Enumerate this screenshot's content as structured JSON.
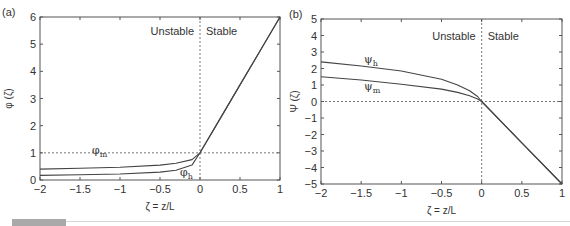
{
  "figure": {
    "footer": {
      "bar_color": "#a9a9a9",
      "line_color": "#d8d8d8"
    }
  },
  "chart_data": [
    {
      "type": "line",
      "panel": "(a)",
      "title": "",
      "xlabel": "ζ = z/L",
      "ylabel": "φ (ζ)",
      "xlim": [
        -2,
        1
      ],
      "ylim": [
        0,
        6
      ],
      "xticks": [
        -2,
        -1.5,
        -1,
        -0.5,
        0,
        0.5,
        1
      ],
      "xtick_labels": [
        "−2",
        "−1.5",
        "−1",
        "−0.5",
        "0",
        "0.5",
        "1"
      ],
      "yticks": [
        0,
        1,
        2,
        3,
        4,
        5,
        6
      ],
      "ytick_labels": [
        "0",
        "1",
        "2",
        "3",
        "4",
        "5",
        "6"
      ],
      "grid": false,
      "reference_lines": {
        "vertical_x": 0,
        "horizontal_y": 1,
        "style": "dashed"
      },
      "region_labels": [
        "Unstable",
        "Stable"
      ],
      "series": [
        {
          "name": "φm",
          "label_main": "φ",
          "label_sub": "m",
          "x": [
            -2,
            -1.5,
            -1,
            -0.5,
            -0.3,
            -0.1,
            0,
            0.25,
            0.5,
            0.75,
            1
          ],
          "y": [
            0.4,
            0.43,
            0.47,
            0.55,
            0.62,
            0.75,
            1.0,
            2.25,
            3.5,
            4.75,
            6.0
          ]
        },
        {
          "name": "φh",
          "label_main": "φ",
          "label_sub": "h",
          "x": [
            -2,
            -1.5,
            -1,
            -0.5,
            -0.3,
            -0.1,
            0,
            0.25,
            0.5,
            0.75,
            1
          ],
          "y": [
            0.17,
            0.19,
            0.22,
            0.29,
            0.36,
            0.55,
            1.0,
            2.25,
            3.5,
            4.75,
            6.0
          ]
        }
      ],
      "panel_label": "(a)"
    },
    {
      "type": "line",
      "panel": "(b)",
      "title": "",
      "xlabel": "ζ = z/L",
      "ylabel": "Ψ (ζ)",
      "xlim": [
        -2,
        1
      ],
      "ylim": [
        -5,
        5
      ],
      "xticks": [
        -2,
        -1.5,
        -1,
        -0.5,
        0,
        0.5,
        1
      ],
      "xtick_labels": [
        "−2",
        "−1.5",
        "−1",
        "−0.5",
        "0",
        "0.5",
        "1"
      ],
      "yticks": [
        -5,
        -4,
        -3,
        -2,
        -1,
        0,
        1,
        2,
        3,
        4,
        5
      ],
      "ytick_labels": [
        "−5",
        "−4",
        "−3",
        "−2",
        "−1",
        "0",
        "1",
        "2",
        "3",
        "4",
        "5"
      ],
      "grid": false,
      "reference_lines": {
        "vertical_x": 0,
        "horizontal_y": 0,
        "style": "dashed"
      },
      "region_labels": [
        "Unstable",
        "Stable"
      ],
      "series": [
        {
          "name": "ψh",
          "label_main": "ψ",
          "label_sub": "h",
          "x": [
            -2,
            -1.5,
            -1,
            -0.5,
            -0.3,
            -0.15,
            -0.05,
            0,
            0.5,
            1
          ],
          "y": [
            2.4,
            2.15,
            1.85,
            1.35,
            1.0,
            0.65,
            0.3,
            0.0,
            -2.5,
            -5.0
          ]
        },
        {
          "name": "ψm",
          "label_main": "ψ",
          "label_sub": "m",
          "x": [
            -2,
            -1.5,
            -1,
            -0.5,
            -0.3,
            -0.15,
            -0.05,
            0,
            0.5,
            1
          ],
          "y": [
            1.5,
            1.3,
            1.05,
            0.75,
            0.55,
            0.35,
            0.15,
            0.0,
            -2.5,
            -5.0
          ]
        }
      ],
      "panel_label": "(b)"
    }
  ]
}
